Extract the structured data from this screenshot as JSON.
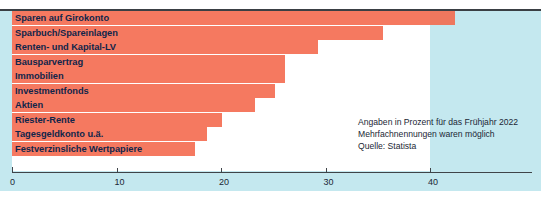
{
  "colors": {
    "panel_background": "#c4e8ef",
    "bar": "#f4664a",
    "label_text": "#10254a",
    "axis": "#3f4449",
    "plot_background": "#ffffff"
  },
  "annotation": {
    "line1": "Angaben in Prozent für das Frühjahr 2022",
    "line2": "Mehrfachnennungen waren möglich",
    "line3": "Quelle: Statista"
  },
  "axis": {
    "ticks": [
      "0",
      "10",
      "20",
      "30",
      "40"
    ]
  },
  "chart_data": {
    "type": "bar",
    "orientation": "horizontal",
    "title": "",
    "subtitle": "",
    "xlabel": "",
    "ylabel": "",
    "xlim": [
      0,
      50
    ],
    "grid": false,
    "legend": false,
    "tick_values": [
      0,
      10,
      20,
      30,
      40
    ],
    "categories": [
      "Sparen auf Girokonto",
      "Sparbuch/Spareinlagen",
      "Renten- und Kapital-LV",
      "Bausparvertrag",
      "Immobilien",
      "Investmentfonds",
      "Aktien",
      "Riester-Rente",
      "Tagesgeldkonto u.ä.",
      "Festverzinsliche Wertpapiere"
    ],
    "values": [
      42.4,
      35.5,
      29.3,
      26.1,
      26.1,
      25.2,
      23.3,
      20.1,
      18.7,
      17.5
    ],
    "annotations": [
      "Angaben in Prozent für das Frühjahr 2022",
      "Mehrfachnennungen waren möglich",
      "Quelle: Statista"
    ]
  }
}
